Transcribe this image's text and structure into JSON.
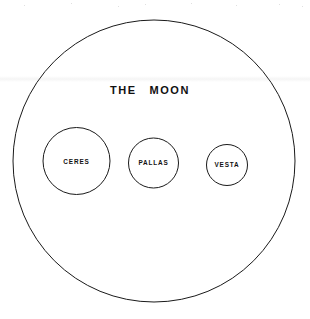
{
  "figure": {
    "background_color": "#ffffff",
    "stroke_color": "#1a1a1a",
    "text_color": "#111111",
    "width": 310,
    "height": 319
  },
  "chart_data": {
    "type": "scatter",
    "subtitle": "",
    "xlabel": "",
    "ylabel": "",
    "grid": false,
    "legend": "none",
    "categories": [
      "THE MOON",
      "CERES",
      "PALLAS",
      "VESTA"
    ],
    "values": [
      282,
      67,
      50,
      41
    ],
    "series": [
      {
        "name": "apparent disc diameter (px)",
        "values": [
          282,
          67,
          50,
          41
        ]
      }
    ],
    "annotations": [
      "THE MOON",
      "CERES",
      "PALLAS",
      "VESTA"
    ],
    "bodies": [
      {
        "label": "THE MOON",
        "role": "reference-disc",
        "cx": 154,
        "cy": 161,
        "r": 141,
        "diameter": 282,
        "label_x": 150,
        "label_y": 91,
        "label_size": "major"
      },
      {
        "label": "CERES",
        "role": "asteroid",
        "cx": 76.5,
        "cy": 161,
        "r": 33.5,
        "diameter": 67,
        "label_x": 76.5,
        "label_y": 162,
        "label_size": "minor"
      },
      {
        "label": "PALLAS",
        "role": "asteroid",
        "cx": 153.5,
        "cy": 163,
        "r": 25,
        "diameter": 50,
        "label_x": 153.5,
        "label_y": 163.5,
        "label_size": "minor"
      },
      {
        "label": "VESTA",
        "role": "asteroid",
        "cx": 227,
        "cy": 165,
        "r": 20.5,
        "diameter": 41,
        "label_x": 227,
        "label_y": 165,
        "label_size": "minor"
      }
    ]
  }
}
